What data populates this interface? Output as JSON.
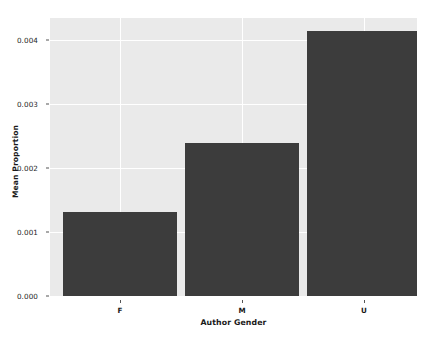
{
  "chart_data": {
    "type": "bar",
    "title": "",
    "subtitle": "",
    "xlabel": "Author Gender",
    "ylabel": "Mean Proportion",
    "categories": [
      "F",
      "M",
      "U"
    ],
    "values": [
      0.00131,
      0.00239,
      0.00414
    ],
    "series": [
      {
        "name": "Mean Proportion",
        "values": [
          0.00131,
          0.00239,
          0.00414
        ]
      }
    ],
    "ylim": [
      0.0,
      0.00435
    ],
    "xlim": [
      -0.5,
      2.5
    ],
    "ytick_labels": [
      "0.000",
      "0.001",
      "0.002",
      "0.003",
      "0.004"
    ],
    "ytick_values": [
      0.0,
      0.001,
      0.002,
      0.003,
      0.004
    ],
    "xtick_labels": [
      "F",
      "M",
      "U"
    ],
    "grid": true,
    "grid_axis": "both",
    "grid_color": "#ffffff",
    "legend": false,
    "legend_position": "none",
    "bar_color": "#3c3c3c",
    "plot_background": "#eaeaea",
    "figure_background": "#ffffff",
    "annotations": []
  }
}
